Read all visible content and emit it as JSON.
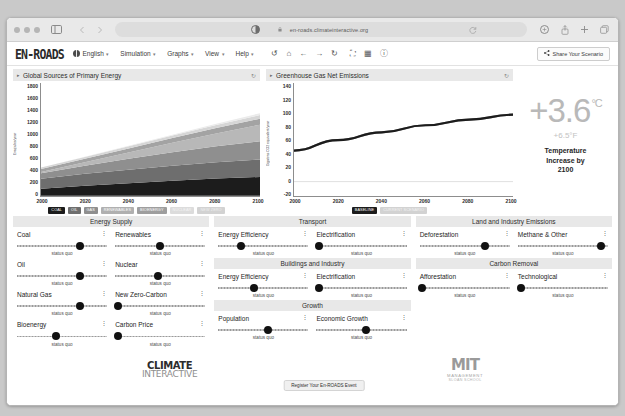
{
  "browser": {
    "url": "en-roads.climateinteractive.org",
    "icons": {
      "sidebar": "sidebar-toggle-icon",
      "back": "back-arrow-icon",
      "forward": "forward-arrow-icon",
      "reader": "reader-mode-icon",
      "shield": "lock-icon",
      "refresh": "refresh-icon",
      "extensions": "extensions-icon",
      "share": "share-icon",
      "new_tab": "new-tab-icon",
      "tabs": "tab-overview-icon"
    }
  },
  "navbar": {
    "brand": "EN-ROADS",
    "items": [
      {
        "label": "English",
        "icon": "globe-icon",
        "caret": "▾"
      },
      {
        "label": "Simulation",
        "caret": "▾"
      },
      {
        "label": "Graphs",
        "caret": "▾"
      },
      {
        "label": "View",
        "caret": "▾"
      },
      {
        "label": "Help",
        "caret": "▾"
      }
    ],
    "tools": [
      {
        "name": "undo-icon",
        "glyph": "↺"
      },
      {
        "name": "home-icon",
        "glyph": "⌂"
      },
      {
        "name": "prev-arrow-icon",
        "glyph": "←"
      },
      {
        "name": "next-arrow-icon",
        "glyph": "→"
      },
      {
        "name": "reset-icon",
        "glyph": "↻"
      },
      {
        "name": "fullscreen-icon",
        "glyph": "⛶"
      },
      {
        "name": "grid-layout-icon",
        "glyph": "▦"
      },
      {
        "name": "info-icon",
        "glyph": "ⓘ"
      }
    ],
    "share_label": "Share Your Scenario",
    "share_icon": "share-node-icon"
  },
  "chart_data": [
    {
      "type": "area",
      "title": "Global Sources of Primary Energy",
      "xlabel": "",
      "ylabel": "Exajoules/year",
      "x": [
        2000,
        2020,
        2040,
        2060,
        2080,
        2100
      ],
      "xlim": [
        2000,
        2100
      ],
      "ylim": [
        0,
        1800
      ],
      "yticks": [
        1800,
        1600,
        1400,
        1200,
        1000,
        800,
        600,
        400,
        200,
        0
      ],
      "xticks": [
        2000,
        2020,
        2040,
        2060,
        2080,
        2100
      ],
      "grid": false,
      "legend_position": "bottom",
      "series": [
        {
          "name": "COAL",
          "color": "#1c1c1c",
          "values": [
            110,
            160,
            200,
            240,
            275,
            300
          ]
        },
        {
          "name": "OIL",
          "color": "#6e6e6e",
          "values": [
            160,
            190,
            215,
            240,
            260,
            280
          ]
        },
        {
          "name": "GAS",
          "color": "#8f8f8f",
          "values": [
            90,
            130,
            175,
            215,
            255,
            290
          ]
        },
        {
          "name": "RENEWABLES",
          "color": "#b8b8b8",
          "values": [
            20,
            55,
            100,
            150,
            205,
            265
          ]
        },
        {
          "name": "BIOENERGY",
          "color": "#a3a3a3",
          "values": [
            45,
            55,
            65,
            75,
            85,
            95
          ]
        },
        {
          "name": "NUCLEAR",
          "color": "#d6d6d6",
          "values": [
            25,
            30,
            35,
            42,
            50,
            58
          ]
        },
        {
          "name": "NEW ZERO",
          "color": "#ebebeb",
          "values": [
            0,
            2,
            6,
            12,
            20,
            30
          ]
        }
      ],
      "legend": [
        {
          "label": "COAL",
          "bg": "#1c1c1c",
          "fg": "#ffffff"
        },
        {
          "label": "OIL",
          "bg": "#6e6e6e",
          "fg": "#ffffff"
        },
        {
          "label": "GAS",
          "bg": "#8f8f8f",
          "fg": "#ffffff"
        },
        {
          "label": "RENEWABLES",
          "bg": "#b0b0b0",
          "fg": "#ffffff"
        },
        {
          "label": "BIOENERGY",
          "bg": "#9e9e9e",
          "fg": "#ffffff"
        },
        {
          "label": "NUCLEAR",
          "bg": "#dcdcdc",
          "fg": "#f4f4f4"
        },
        {
          "label": "NEW ZERO",
          "bg": "#d2d2d2",
          "fg": "#f0f0f0"
        }
      ]
    },
    {
      "type": "line",
      "title": "Greenhouse Gas Net Emissions",
      "xlabel": "",
      "ylabel": "Gigatons CO2 equivalent/year",
      "x": [
        2000,
        2020,
        2040,
        2060,
        2080,
        2100
      ],
      "xlim": [
        2000,
        2100
      ],
      "ylim": [
        -20,
        140
      ],
      "yticks": [
        140,
        120,
        100,
        80,
        60,
        40,
        20,
        0,
        -20
      ],
      "xticks": [
        2000,
        2020,
        2040,
        2060,
        2080,
        2100
      ],
      "grid": false,
      "legend_position": "bottom",
      "series": [
        {
          "name": "BASELINE",
          "color": "#1c1c1c",
          "values": [
            44,
            59,
            70,
            80,
            88,
            95
          ]
        },
        {
          "name": "CURRENT SCENARIO",
          "color": "#8a8a8a",
          "values": [
            44,
            59,
            70,
            80,
            88,
            95
          ]
        }
      ],
      "legend": [
        {
          "label": "BASELINE",
          "bg": "#1c1c1c",
          "fg": "#ffffff"
        },
        {
          "label": "CURRENT SCENARIO",
          "bg": "#d2d2d2",
          "fg": "#f2f2f2"
        }
      ]
    }
  ],
  "temperature": {
    "celsius": "+3.6",
    "unit_c": "°C",
    "fahrenheit": "+6.5°F",
    "caption_line1": "Temperature",
    "caption_line2": "Increase by",
    "caption_line3": "2100"
  },
  "panels": [
    {
      "name": "left-column",
      "sections": [
        {
          "title": "Energy Supply",
          "rows": [
            [
              {
                "label": "Coal",
                "status": "status quo",
                "knob": 70
              },
              {
                "label": "Renewables",
                "status": "status quo",
                "knob": 50
              }
            ],
            [
              {
                "label": "Oil",
                "status": "status quo",
                "knob": 70
              },
              {
                "label": "Nuclear",
                "status": "status quo",
                "knob": 47
              }
            ],
            [
              {
                "label": "Natural Gas",
                "status": "status quo",
                "knob": 70
              },
              {
                "label": "New Zero-Carbon",
                "status": "status quo",
                "knob": 3
              }
            ],
            [
              {
                "label": "Bioenergy",
                "status": "status quo",
                "knob": 43
              },
              {
                "label": "Carbon Price",
                "status": "status quo",
                "knob": 3
              }
            ]
          ]
        }
      ]
    },
    {
      "name": "middle-column",
      "sections": [
        {
          "title": "Transport",
          "rows": [
            [
              {
                "label": "Energy Efficiency",
                "status": "status quo",
                "knob": 25
              },
              {
                "label": "Electrification",
                "status": "status quo",
                "knob": 3
              }
            ]
          ]
        },
        {
          "title": "Buildings and Industry",
          "rows": [
            [
              {
                "label": "Energy Efficiency",
                "status": "status quo",
                "knob": 40
              },
              {
                "label": "Electrification",
                "status": "status quo",
                "knob": 3
              }
            ]
          ]
        },
        {
          "title": "Growth",
          "rows": [
            [
              {
                "label": "Population",
                "status": "status quo",
                "knob": 55
              },
              {
                "label": "Economic Growth",
                "status": "status quo",
                "knob": 55
              }
            ]
          ]
        }
      ]
    },
    {
      "name": "right-column",
      "sections": [
        {
          "title": "Land and Industry Emissions",
          "rows": [
            [
              {
                "label": "Deforestation",
                "status": "status quo",
                "knob": 72
              },
              {
                "label": "Methane & Other",
                "status": "status quo",
                "knob": 92
              }
            ]
          ]
        },
        {
          "title": "Carbon Removal",
          "rows": [
            [
              {
                "label": "Afforestation",
                "status": "status quo",
                "knob": 3
              },
              {
                "label": "Technological",
                "status": "status quo",
                "knob": 3
              }
            ]
          ]
        }
      ]
    }
  ],
  "footer": {
    "climate_interactive_top": "CLIMATE",
    "climate_interactive_bottom": "INTERACTIVE",
    "mit_top": "MIT",
    "mit_sub1": "MANAGEMENT",
    "mit_sub2": "SLOAN SCHOOL",
    "register_label": "Register Your En-ROADS Event"
  },
  "kebab_glyph": "⋮"
}
